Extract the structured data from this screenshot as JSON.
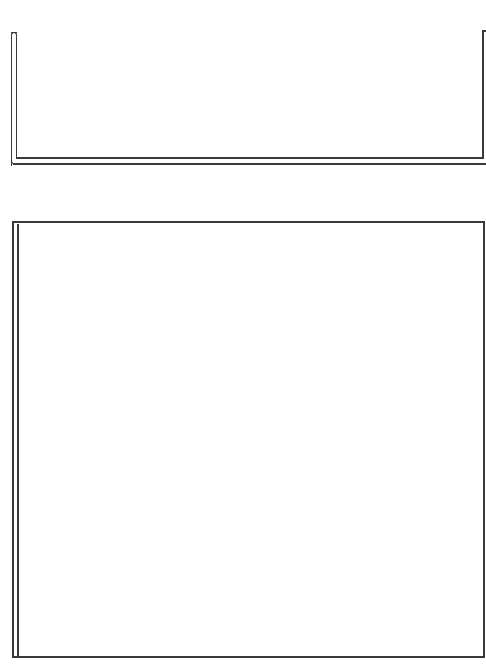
{
  "theme": {
    "stroke_color": "#3a3a3a",
    "background_color": "#ffffff"
  },
  "top_panel": {
    "content": ""
  },
  "bottom_panel": {
    "content": ""
  }
}
